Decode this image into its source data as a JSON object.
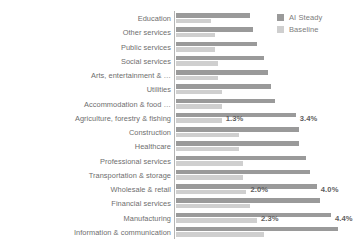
{
  "legend": {
    "position": "top-right",
    "entries": [
      {
        "label": "AI Steady",
        "color": "#9a9a9a"
      },
      {
        "label": "Baseline",
        "color": "#cfcfcf"
      }
    ]
  },
  "colors": {
    "steady": "#9a9a9a",
    "baseline": "#cfcfcf",
    "axis": "#b4b4b4",
    "text": "#6e6e6e",
    "background": "#ffffff"
  },
  "chart_data": {
    "type": "bar",
    "orientation": "horizontal",
    "title": "",
    "xlabel": "",
    "ylabel": "",
    "grid": false,
    "legend_position": "top-right",
    "xlim": [
      0,
      5.0
    ],
    "categories": [
      "Education",
      "Other services",
      "Public services",
      "Social services",
      "Arts, entertainment & …",
      "Utilities",
      "Accommodation & food …",
      "Agriculture, forestry & fishing",
      "Construction",
      "Healthcare",
      "Professional services",
      "Transportation & storage",
      "Wholesale & retail",
      "Financial services",
      "Manufacturing",
      "Information & communication"
    ],
    "series": [
      {
        "name": "AI Steady",
        "color": "#9a9a9a",
        "values": [
          2.1,
          2.2,
          2.3,
          2.5,
          2.6,
          2.7,
          2.8,
          3.4,
          3.5,
          3.5,
          3.7,
          3.8,
          4.0,
          4.1,
          4.4,
          4.6
        ]
      },
      {
        "name": "Baseline",
        "color": "#cfcfcf",
        "values": [
          1.0,
          1.1,
          1.1,
          1.2,
          1.2,
          1.3,
          1.3,
          1.3,
          1.8,
          1.8,
          1.9,
          1.9,
          2.0,
          2.1,
          2.3,
          2.5
        ]
      }
    ],
    "data_labels": [
      {
        "category": "Agriculture, forestry & fishing",
        "baseline": "1.3%",
        "steady": "3.4%"
      },
      {
        "category": "Wholesale & retail",
        "baseline": "2.0%",
        "steady": "4.0%"
      },
      {
        "category": "Manufacturing",
        "baseline": "2.3%",
        "steady": "4.4%"
      }
    ]
  }
}
